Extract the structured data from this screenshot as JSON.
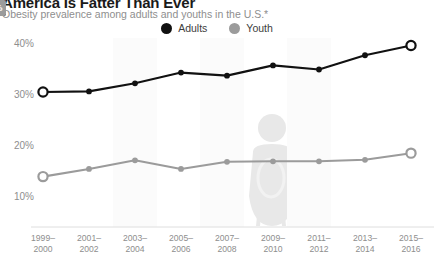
{
  "header": {
    "title": "America Is Fatter Than Ever",
    "subtitle": "Obesity prevalence among adults and youths in the U.S.*"
  },
  "legend": {
    "position": "top-center",
    "items": [
      {
        "label": "Adults",
        "color": "#111111",
        "icon": "legend-dot-icon"
      },
      {
        "label": "Youth",
        "color": "#9b9b9b",
        "icon": "legend-dot-icon"
      }
    ]
  },
  "axes": {
    "y_ticks": [
      "40%",
      "30%",
      "20%",
      "10%"
    ],
    "x_ticks": [
      {
        "line1": "1999–",
        "line2": "2000"
      },
      {
        "line1": "2001–",
        "line2": "2002"
      },
      {
        "line1": "2003–",
        "line2": "2004"
      },
      {
        "line1": "2005–",
        "line2": "2006"
      },
      {
        "line1": "2007–",
        "line2": "2008"
      },
      {
        "line1": "2009–",
        "line2": "2010"
      },
      {
        "line1": "2011–",
        "line2": "2012"
      },
      {
        "line1": "2013–",
        "line2": "2014"
      },
      {
        "line1": "2015–",
        "line2": "2016"
      }
    ]
  },
  "annotations": [
    {
      "text": "30.5%",
      "style": "dark",
      "series": "Adults",
      "point": "1999-2000"
    },
    {
      "text": "39.6%",
      "style": "dark",
      "series": "Adults",
      "point": "2015-2016"
    },
    {
      "text": "13.9%",
      "style": "gray",
      "series": "Youth",
      "point": "1999-2000"
    },
    {
      "text": "18.5%",
      "style": "gray",
      "series": "Youth",
      "point": "2015-2016"
    }
  ],
  "chart_data": {
    "type": "line",
    "title": "America Is Fatter Than Ever",
    "subtitle": "Obesity prevalence among adults and youths in the U.S.*",
    "xlabel": "",
    "ylabel": "",
    "ylim": [
      5,
      42
    ],
    "yticks": [
      10,
      20,
      30,
      40
    ],
    "ytick_labels": [
      "10%",
      "20%",
      "30%",
      "40%"
    ],
    "grid": false,
    "legend_position": "top-center",
    "categories": [
      "1999–2000",
      "2001–2002",
      "2003–2004",
      "2005–2006",
      "2007–2008",
      "2009–2010",
      "2011–2012",
      "2013–2014",
      "2015–2016"
    ],
    "series": [
      {
        "name": "Adults",
        "color": "#111111",
        "values": [
          30.5,
          30.6,
          32.2,
          34.3,
          33.7,
          35.7,
          34.9,
          37.7,
          39.6
        ]
      },
      {
        "name": "Youth",
        "color": "#9b9b9b",
        "values": [
          13.9,
          15.4,
          17.1,
          15.4,
          16.8,
          16.9,
          16.9,
          17.2,
          18.5
        ]
      }
    ]
  },
  "watermark": {
    "icon": "overweight-person-silhouette-icon",
    "color": "#e8e8e8"
  }
}
